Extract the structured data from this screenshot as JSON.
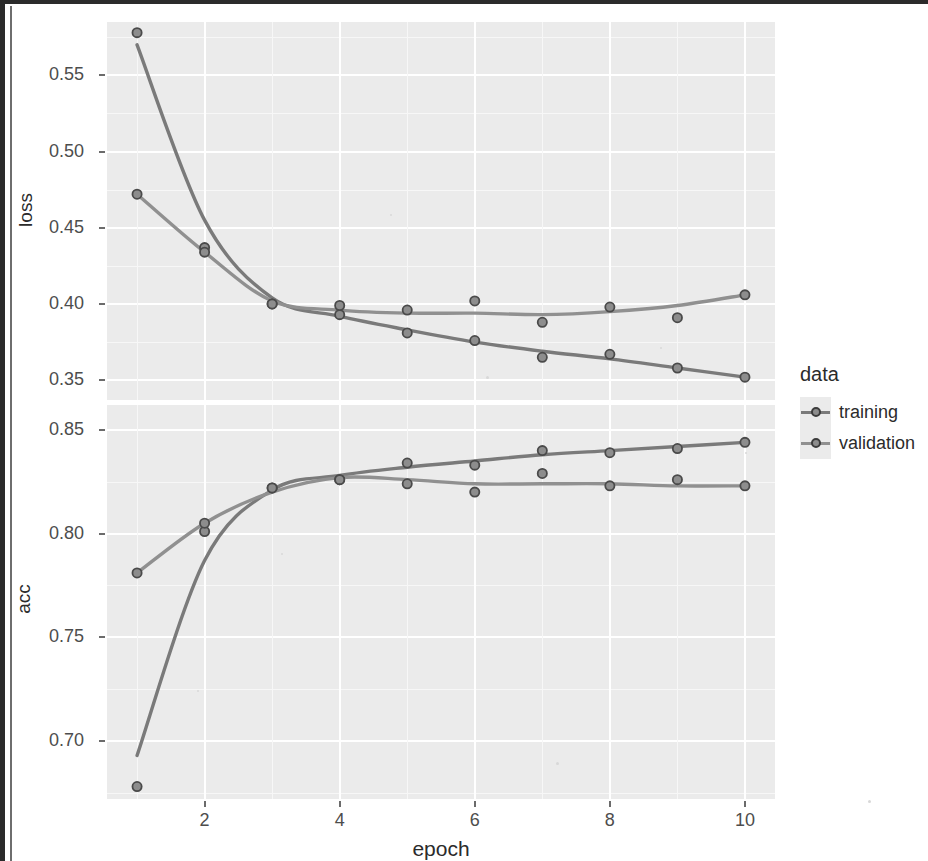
{
  "figure": {
    "x_axis_title": "epoch",
    "x_ticks": [
      "2",
      "4",
      "6",
      "8",
      "10"
    ],
    "panels": [
      {
        "key": "loss",
        "y_title": "loss",
        "y_ticks": [
          "0.55",
          "0.50",
          "0.45",
          "0.40",
          "0.35"
        ]
      },
      {
        "key": "acc",
        "y_title": "acc",
        "y_ticks": [
          "0.85",
          "0.80",
          "0.75",
          "0.70"
        ]
      }
    ]
  },
  "legend": {
    "title": "data",
    "items": [
      {
        "label": "training",
        "color": "#7a7a7a"
      },
      {
        "label": "validation",
        "color": "#909090"
      }
    ]
  },
  "chart_data": {
    "type": "line",
    "title": "",
    "xlabel": "epoch",
    "grid": true,
    "legend_position": "right",
    "legend_title": "data",
    "x": [
      1,
      2,
      3,
      4,
      5,
      6,
      7,
      8,
      9,
      10
    ],
    "xlim": [
      1,
      10
    ],
    "x_ticks": [
      2,
      4,
      6,
      8,
      10
    ],
    "facets": [
      {
        "name": "loss",
        "ylabel": "loss",
        "ylim": [
          0.337,
          0.585
        ],
        "y_ticks": [
          0.55,
          0.5,
          0.45,
          0.4,
          0.35
        ],
        "series": [
          {
            "name": "training",
            "color": "#7a7a7a",
            "values": [
              0.578,
              0.437,
              0.4,
              0.393,
              0.381,
              0.376,
              0.365,
              0.367,
              0.358,
              0.352
            ],
            "smooth_values": [
              0.57,
              0.455,
              0.404,
              0.392,
              0.383,
              0.375,
              0.369,
              0.364,
              0.358,
              0.352
            ]
          },
          {
            "name": "validation",
            "color": "#909090",
            "values": [
              0.472,
              0.434,
              0.4,
              0.399,
              0.396,
              0.402,
              0.388,
              0.398,
              0.391,
              0.406
            ],
            "smooth_values": [
              0.472,
              0.434,
              0.402,
              0.396,
              0.394,
              0.394,
              0.393,
              0.395,
              0.399,
              0.406
            ]
          }
        ]
      },
      {
        "name": "acc",
        "ylabel": "acc",
        "ylim": [
          0.672,
          0.862
        ],
        "y_ticks": [
          0.85,
          0.8,
          0.75,
          0.7
        ],
        "series": [
          {
            "name": "training",
            "color": "#7a7a7a",
            "values": [
              0.678,
              0.801,
              0.822,
              0.826,
              0.834,
              0.833,
              0.84,
              0.839,
              0.841,
              0.844
            ],
            "smooth_values": [
              0.693,
              0.787,
              0.821,
              0.828,
              0.832,
              0.835,
              0.838,
              0.84,
              0.842,
              0.844
            ]
          },
          {
            "name": "validation",
            "color": "#909090",
            "values": [
              0.781,
              0.805,
              0.822,
              0.826,
              0.824,
              0.82,
              0.829,
              0.823,
              0.826,
              0.823
            ],
            "smooth_values": [
              0.781,
              0.805,
              0.82,
              0.827,
              0.826,
              0.824,
              0.824,
              0.824,
              0.823,
              0.823
            ]
          }
        ]
      }
    ]
  }
}
